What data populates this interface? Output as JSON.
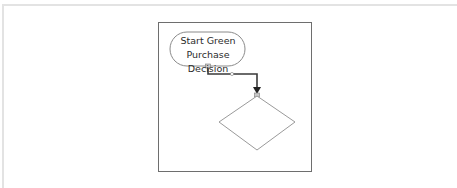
{
  "diagram": {
    "type": "flowchart",
    "nodes": [
      {
        "id": "start",
        "shape": "terminator",
        "label_line1": "Start Green",
        "label_line2": "Purchase Decision"
      },
      {
        "id": "decision",
        "shape": "diamond",
        "label": ""
      }
    ],
    "edges": [
      {
        "from": "start",
        "to": "decision",
        "style": "elbow-arrow"
      }
    ],
    "colors": {
      "stroke": "#8a8a8a",
      "connector": "#3a3a3a",
      "frame": "#6e6e6e",
      "outer_border": "#e3e3e3",
      "text": "#2b2b2b"
    }
  }
}
